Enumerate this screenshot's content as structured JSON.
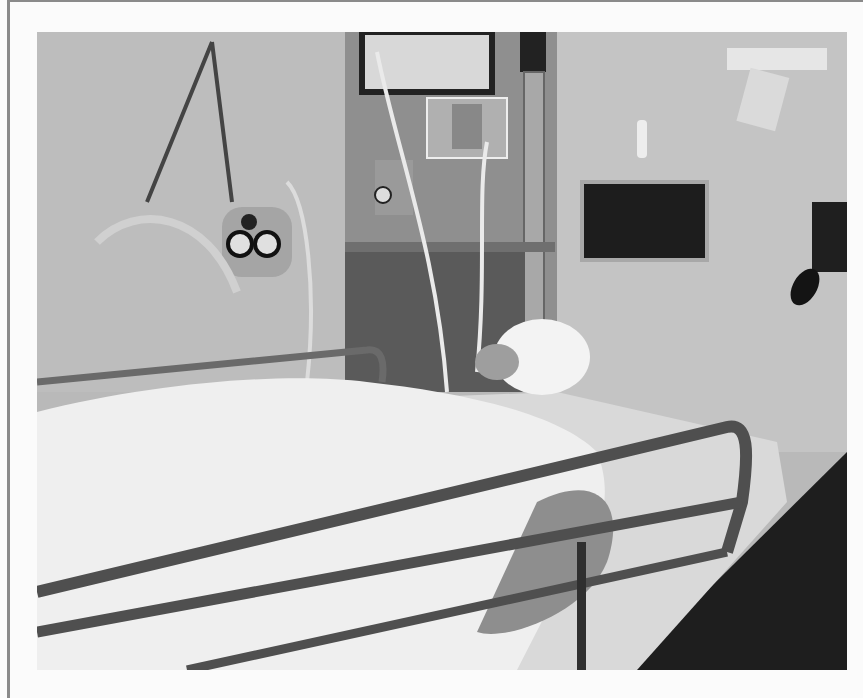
{
  "image": {
    "kind": "photograph",
    "color_mode": "grayscale",
    "subject": "hospital patient with bandaged head lying in bed with metal side rails",
    "scene_elements": [
      "wall-mounted oxygen/suction regulator with two round gauges",
      "IV pole with hanging tubing",
      "wall equipment panel with monitor",
      "flow meter",
      "dark rectangular wall panel",
      "wall clip holder",
      "blood pressure cuff bulb",
      "metal bed side rails",
      "white bed sheet"
    ]
  },
  "frame": {
    "border_color": "#8a8a8a",
    "background_color": "#fbfbfb"
  },
  "palette": {
    "wall": "#b9b9b9",
    "wall_light": "#c8c8c8",
    "panel_dark": "#2a2a2a",
    "sheet": "#ececec",
    "rail": "#5a5a5a",
    "floor": "#1e1e1e"
  }
}
